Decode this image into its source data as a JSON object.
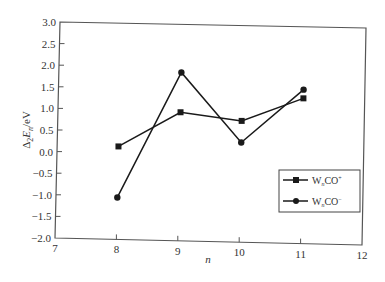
{
  "chart_data": {
    "type": "line",
    "title": "",
    "xlabel": "n",
    "ylabel": "Δ₂E_n/eV",
    "ylabel_parts": {
      "delta": "Δ",
      "sub2": "2",
      "E": "E",
      "subn": "n",
      "unit": "/eV"
    },
    "x": [
      8,
      9,
      10,
      11
    ],
    "xlim": [
      7,
      12
    ],
    "ylim": [
      -2.0,
      3.0
    ],
    "xticks": [
      "7",
      "8",
      "9",
      "10",
      "11",
      "12"
    ],
    "yticks": [
      "3.0",
      "2.5",
      "2.0",
      "1.5",
      "1.0",
      "0.5",
      "0.0",
      "−0.5",
      "−1.0",
      "−1.5",
      "−2.0"
    ],
    "grid": false,
    "legend_position": "lower right (inside)",
    "series": [
      {
        "name": "WₙCO⁺",
        "base": "W",
        "sub": "n",
        "rest": "CO",
        "sup": "+",
        "marker": "square",
        "values": [
          0.15,
          0.97,
          0.8,
          1.35
        ]
      },
      {
        "name": "WₙCO⁻",
        "base": "W",
        "sub": "n",
        "rest": "CO",
        "sup": "−",
        "marker": "circle",
        "values": [
          -1.03,
          1.89,
          0.3,
          1.55
        ]
      }
    ]
  },
  "colors": {
    "line": "#1a1a1a",
    "frame": "#444444"
  }
}
